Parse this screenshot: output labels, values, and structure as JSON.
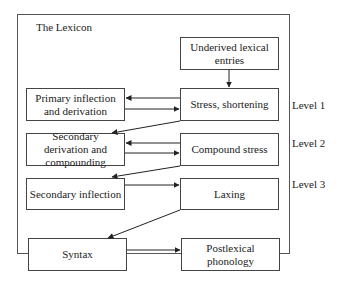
{
  "lexicon": {
    "title": "The Lexicon"
  },
  "boxes": {
    "underived": "Underived lexical entries",
    "primary": "Primary inflection and derivation",
    "stress": "Stress, shortening",
    "secondary_derivation": "Secondary derivation and compounding",
    "compound_stress": "Compound stress",
    "secondary_inflection": "Secondary inflection",
    "laxing": "Laxing",
    "syntax": "Syntax",
    "postlexical": "Postlexical phonology"
  },
  "levels": [
    "Level 1",
    "Level 2",
    "Level 3"
  ]
}
